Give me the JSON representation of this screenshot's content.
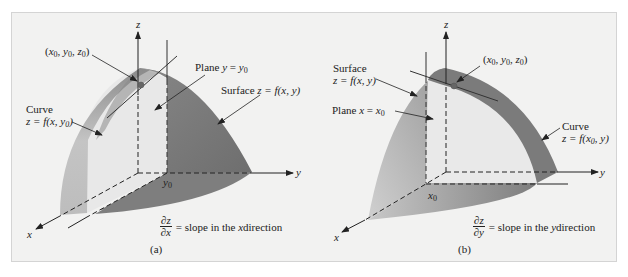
{
  "figure": {
    "background": "#f2f2f1",
    "colors": {
      "surface_dark": "#7a7a7a",
      "surface_light": "#cfcfcf",
      "curve_band": "#b9b9b9",
      "plane": "#e6e6e6",
      "axis": "#222222"
    }
  },
  "panel_a": {
    "caption": "(a)",
    "axes": {
      "z": "z",
      "y": "y",
      "x": "x"
    },
    "tick_y0": "y",
    "tick_y0_sub": "0",
    "point_label": {
      "open": "(",
      "x": "x",
      "x_sub": "0",
      "y": "y",
      "y_sub": "0",
      "z": "z",
      "z_sub": "0",
      "close": ")"
    },
    "plane_label": {
      "prefix": "Plane ",
      "var": "y",
      "eq": " = ",
      "val": "y",
      "val_sub": "0"
    },
    "surface_label": {
      "prefix": "Surface ",
      "expr": "z = f(x, y)"
    },
    "curve_label": {
      "line1": "Curve",
      "line2_prefix": "z = f(x, y",
      "line2_sub": "0",
      "line2_suffix": ")"
    },
    "slope": {
      "num": "∂z",
      "den": "∂x",
      "text_prefix": "= slope in the ",
      "var": "x",
      "text_suffix": " direction"
    }
  },
  "panel_b": {
    "caption": "(b)",
    "axes": {
      "z": "z",
      "y": "y",
      "x": "x"
    },
    "tick_x0": "x",
    "tick_x0_sub": "0",
    "point_label": {
      "open": "(",
      "x": "x",
      "x_sub": "0",
      "y": "y",
      "y_sub": "0",
      "z": "z",
      "z_sub": "0",
      "close": ")"
    },
    "plane_label": {
      "prefix": "Plane ",
      "var": "x",
      "eq": " = ",
      "val": "x",
      "val_sub": "0"
    },
    "surface_label": {
      "line1": "Surface",
      "line2": "z = f(x, y)"
    },
    "curve_label": {
      "line1": "Curve",
      "line2_prefix": "z = f(x",
      "line2_sub": "0",
      "line2_suffix": ", y)"
    },
    "slope": {
      "num": "∂z",
      "den": "∂y",
      "text_prefix": "= slope in the ",
      "var": "y",
      "text_suffix": " direction"
    }
  }
}
